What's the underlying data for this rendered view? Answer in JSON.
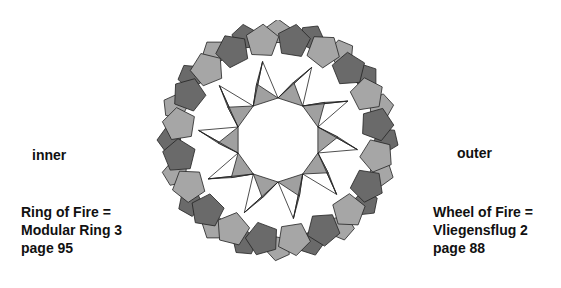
{
  "labels": {
    "left": "inner",
    "right": "outer"
  },
  "captions": {
    "left": [
      "Ring of Fire =",
      "Modular Ring 3",
      "page 95"
    ],
    "right": [
      "Wheel of Fire =",
      "Vliegensflug 2",
      "page 88"
    ]
  },
  "figure": {
    "colors": {
      "light": "#a6a6a6",
      "dark": "#6a6a6a",
      "inner": "#a0a0a0",
      "stroke": "#222222"
    },
    "outer_units": 20,
    "inner_points": 10
  }
}
